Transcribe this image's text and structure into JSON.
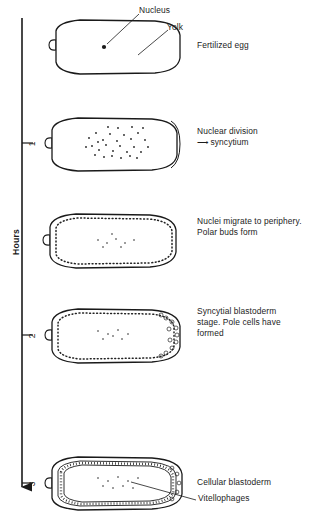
{
  "figure": {
    "axis": {
      "title": "Hours",
      "ticks": [
        {
          "value": "1",
          "y": 143
        },
        {
          "value": "2",
          "y": 335
        },
        {
          "value": "3",
          "y": 483
        }
      ],
      "direction": "downward-arrow"
    },
    "callouts": [
      {
        "name": "nucleus",
        "text": "Nucleus"
      },
      {
        "name": "yolk",
        "text": "Yolk"
      },
      {
        "name": "vitellophages",
        "text": "Vitellophages"
      }
    ],
    "stages": [
      {
        "id": "fertilized-egg",
        "label": "Fertilized egg",
        "label_y": 40,
        "cy": 47,
        "description": "single nucleus in uniform yolk"
      },
      {
        "id": "nuclear-division",
        "label": "Nuclear division\n⟶ syncytium",
        "label_y": 126,
        "cy": 143,
        "description": "many central nuclei, no cell membranes"
      },
      {
        "id": "nuclei-migrate",
        "label": "Nuclei migrate to periphery.\nPolar buds form",
        "label_y": 216,
        "cy": 240,
        "description": "nuclei form dotted ring at cortex"
      },
      {
        "id": "syncytial-blastoderm",
        "label": "Syncytial blastoderm\nstage. Pole cells have\nformed",
        "label_y": 306,
        "cy": 335,
        "description": "pole cells bud at posterior pole"
      },
      {
        "id": "cellular-blastoderm",
        "label": "Cellular blastoderm",
        "label_y": 477,
        "cy": 483,
        "description": "cellularized cortical layer, vitellophages inside"
      }
    ],
    "colors": {
      "ink": "#1a1a1a",
      "background": "#ffffff",
      "stipple": "#333333"
    }
  }
}
